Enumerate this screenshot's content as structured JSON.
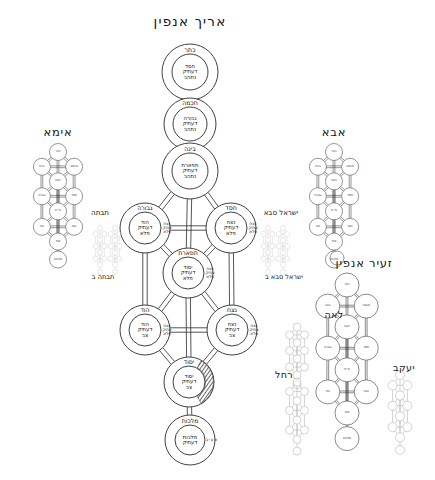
{
  "titles": {
    "main": "אריך אנפין",
    "left_tree": "אימא",
    "right_tree": "אבא",
    "zeir_anpin": "זעיר אנפין",
    "leah": "לאה",
    "rachel": "רחל",
    "yaakov": "יעקב"
  },
  "side_labels": {
    "left_upper": "תבתה",
    "left_lower": "תבתה ב",
    "right_upper": "ישראל סבא",
    "right_lower": "ישראל סבא ב"
  },
  "main_tree": {
    "nodes": [
      {
        "id": "keter",
        "name": "כתר",
        "inner": "חסד\nדעתיק\nנתהב",
        "side_tag": "",
        "cx": 190,
        "cy": 72,
        "r_outer": 28,
        "r_inner": 18,
        "shaded": false
      },
      {
        "id": "chochmah",
        "name": "חכמה",
        "inner": "גבורה\nדעתיק\nנתהב",
        "side_tag": "",
        "cx": 190,
        "cy": 124,
        "r_outer": 26,
        "r_inner": 17,
        "shaded": false
      },
      {
        "id": "binah",
        "name": "בינה",
        "inner": "תפארת\nדעתיק\nנתהב",
        "side_tag": "",
        "cx": 190,
        "cy": 171,
        "r_outer": 28,
        "r_inner": 18,
        "shaded": false
      },
      {
        "id": "gevurah",
        "name": "גבורה",
        "inner": "הוד\nדעתיק\nפלא",
        "side_tag": "נצח\nעתיק\nפלא",
        "cx": 145,
        "cy": 228,
        "r_outer": 25,
        "r_inner": 16,
        "shaded": false
      },
      {
        "id": "chesed",
        "name": "חסד",
        "inner": "נצח\nדעתיק\nפלא",
        "side_tag": "נצח\nעתיק\nפלא",
        "cx": 231,
        "cy": 228,
        "r_outer": 25,
        "r_inner": 16,
        "shaded": false
      },
      {
        "id": "tiferet",
        "name": "תפארת",
        "inner": "יסוד\nדעתיק\nפלא",
        "side_tag": "נצח\nעתיק\nפלא",
        "cx": 188,
        "cy": 273,
        "r_outer": 25,
        "r_inner": 16,
        "shaded": false
      },
      {
        "id": "hod",
        "name": "הוד",
        "inner": "הוד\nדעתיק\nצב",
        "side_tag": "נצח\nעתיק\nפלא",
        "cx": 145,
        "cy": 330,
        "r_outer": 25,
        "r_inner": 16,
        "shaded": false
      },
      {
        "id": "netzach",
        "name": "נצח",
        "inner": "נצח\nדעתיק\nצב",
        "side_tag": "נצח\nעתיק\nפלא",
        "cx": 232,
        "cy": 330,
        "r_outer": 25,
        "r_inner": 16,
        "shaded": false
      },
      {
        "id": "yesod",
        "name": "יסוד",
        "inner": "יסוד\nדעתיק\nצב",
        "side_tag": "",
        "cx": 189,
        "cy": 382,
        "r_outer": 25,
        "r_inner": 16,
        "shaded": true
      },
      {
        "id": "malchut",
        "name": "מלכות",
        "inner": "מלכות\nדעתיק",
        "side_tag": "א ע״ב",
        "cx": 190,
        "cy": 440,
        "r_outer": 25,
        "r_inner": 15,
        "shaded": false
      }
    ],
    "edges": [
      [
        "keter",
        "chochmah"
      ],
      [
        "chochmah",
        "binah"
      ],
      [
        "binah",
        "gevurah"
      ],
      [
        "binah",
        "chesed"
      ],
      [
        "binah",
        "tiferet"
      ],
      [
        "gevurah",
        "chesed"
      ],
      [
        "gevurah",
        "tiferet"
      ],
      [
        "chesed",
        "tiferet"
      ],
      [
        "gevurah",
        "hod"
      ],
      [
        "chesed",
        "netzach"
      ],
      [
        "tiferet",
        "hod"
      ],
      [
        "tiferet",
        "netzach"
      ],
      [
        "tiferet",
        "yesod"
      ],
      [
        "hod",
        "netzach"
      ],
      [
        "hod",
        "yesod"
      ],
      [
        "netzach",
        "yesod"
      ],
      [
        "yesod",
        "malchut"
      ]
    ]
  },
  "side_trees": {
    "imma": {
      "labels": [
        "כתר",
        "בינה",
        "חכמה",
        "דעת",
        "גבורה",
        "חסד",
        "ת״ת",
        "הוד",
        "נצח",
        "יסוד",
        "מלכות"
      ]
    },
    "abba": {
      "labels": [
        "כתר",
        "בינה",
        "חכמה",
        "דעת",
        "גבורה",
        "חסד",
        "ת״ת",
        "הוד",
        "נצח",
        "יסוד",
        "מלכות"
      ]
    },
    "zeir_anpin": {
      "labels": [
        "כתר",
        "בינה",
        "חכמה",
        "דעת",
        "גבורה",
        "חסד",
        "ת״ת",
        "הוד",
        "נצח",
        "יסוד",
        "מלכות"
      ]
    },
    "leah": {
      "labels": [
        "",
        "",
        "",
        "",
        "",
        "",
        "",
        "",
        "",
        "",
        ""
      ]
    },
    "rachel": {
      "labels": [
        "",
        "",
        "",
        "",
        "",
        "",
        "",
        "",
        "",
        "",
        ""
      ]
    },
    "yaakov": {
      "labels": [
        "",
        "",
        "",
        "",
        "",
        "",
        "",
        "",
        "",
        "",
        ""
      ]
    }
  },
  "colors": {
    "ink": "#1a1a1a",
    "line": "#2b2b2b",
    "paper": "#ffffff",
    "faint": "#9a9a9a"
  }
}
